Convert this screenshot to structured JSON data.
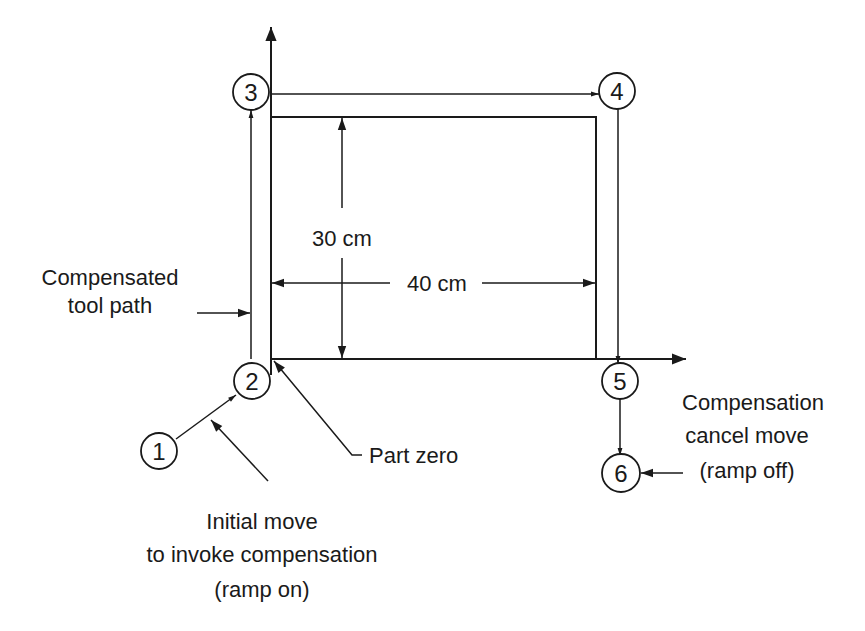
{
  "diagram": {
    "type": "cutter-compensation-toolpath",
    "colors": {
      "line": "#1a1a1a",
      "background": "#ffffff"
    },
    "axes": {
      "x_axis": "horizontal-arrow",
      "y_axis": "vertical-arrow"
    },
    "part": {
      "width_label": "40 cm",
      "height_label": "30 cm"
    },
    "points": [
      {
        "id": "1",
        "label": "1"
      },
      {
        "id": "2",
        "label": "2"
      },
      {
        "id": "3",
        "label": "3"
      },
      {
        "id": "4",
        "label": "4"
      },
      {
        "id": "5",
        "label": "5"
      },
      {
        "id": "6",
        "label": "6"
      }
    ],
    "annotations": {
      "compensated_path": {
        "line1": "Compensated",
        "line2": "tool path"
      },
      "part_zero": {
        "text": "Part zero"
      },
      "initial_move": {
        "line1": "Initial move",
        "line2": "to invoke compensation",
        "line3": "(ramp on)"
      },
      "cancel_move": {
        "line1": "Compensation",
        "line2": "cancel move",
        "line3": "(ramp off)"
      }
    }
  }
}
